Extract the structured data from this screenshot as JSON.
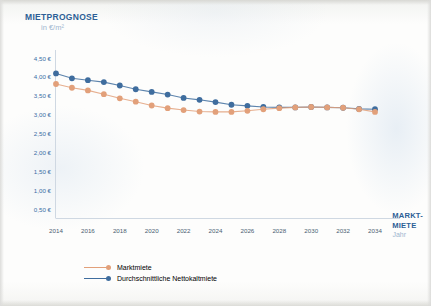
{
  "title": "MIETPROGNOSE",
  "subtitle": "in €/m²",
  "axis_right": {
    "label_line1": "MARKT-",
    "label_line2": "MIETE",
    "sublabel": "Jahr"
  },
  "colors": {
    "title_blue": "#2d5f96",
    "series_blue": "#3f6d9e",
    "series_orange": "#e2a07a",
    "tick_blue": "#3a6ea5",
    "muted": "#9db6cf",
    "background": "#fdfdfb"
  },
  "legend": {
    "items": [
      {
        "label": "Marktmiete",
        "color": "#e2a07a"
      },
      {
        "label": "Durchschnittliche Nettokaltmiete",
        "color": "#3f6d9e"
      }
    ]
  },
  "chart_data": {
    "type": "line",
    "title": "MIETPROGNOSE",
    "subtitle": "in €/m²",
    "xlabel": "Jahr",
    "ylabel": "in €/m²",
    "xlim": [
      2014,
      2034
    ],
    "ylim": [
      0,
      4.5
    ],
    "grid": false,
    "legend_position": "bottom-left",
    "ytick_labels": [
      "4,50 €",
      "4,00 €",
      "3,50 €",
      "3,00 €",
      "2,50 €",
      "2,00 €",
      "1,50 €",
      "1,00 €",
      "0,50 €"
    ],
    "ytick_values": [
      4.5,
      4.0,
      3.5,
      3.0,
      2.5,
      2.0,
      1.5,
      1.0,
      0.5
    ],
    "xtick_labels": [
      "2014",
      "2016",
      "2018",
      "2020",
      "2022",
      "2024",
      "2026",
      "2028",
      "2030",
      "2032",
      "2034"
    ],
    "xtick_values": [
      2014,
      2016,
      2018,
      2020,
      2022,
      2024,
      2026,
      2028,
      2030,
      2032,
      2034
    ],
    "x": [
      2014,
      2015,
      2016,
      2017,
      2018,
      2019,
      2020,
      2021,
      2022,
      2023,
      2024,
      2025,
      2026,
      2027,
      2028,
      2029,
      2030,
      2031,
      2032,
      2033,
      2034
    ],
    "series": [
      {
        "name": "Durchschnittliche Nettokaltmiete",
        "color": "#3f6d9e",
        "values": [
          4.1,
          3.97,
          3.92,
          3.87,
          3.78,
          3.68,
          3.61,
          3.54,
          3.45,
          3.4,
          3.34,
          3.27,
          3.24,
          3.21,
          3.2,
          3.2,
          3.21,
          3.2,
          3.19,
          3.16,
          3.15
        ]
      },
      {
        "name": "Marktmiete",
        "color": "#e2a07a",
        "values": [
          3.82,
          3.72,
          3.65,
          3.55,
          3.44,
          3.35,
          3.25,
          3.18,
          3.13,
          3.09,
          3.08,
          3.08,
          3.11,
          3.15,
          3.18,
          3.2,
          3.21,
          3.2,
          3.19,
          3.15,
          3.08
        ]
      }
    ]
  }
}
